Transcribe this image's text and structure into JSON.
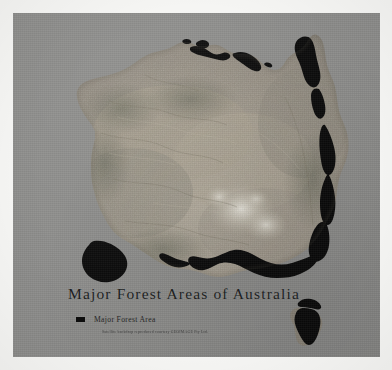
{
  "page": {
    "background_color": "#f7f7f5",
    "panel_color": "#8e8e8c"
  },
  "map": {
    "title": "Major Forest Areas of Australia",
    "subject": "Australia",
    "imagery_type": "satellite-backdrop",
    "land_color": "#9a968e",
    "forest_color": "#0b0b0b",
    "ocean_color": "#8e8e8c"
  },
  "legend": {
    "items": [
      {
        "label": "Major Forest Area",
        "swatch_color": "#0d0d0d",
        "swatch_name": "forest-area-swatch"
      }
    ]
  },
  "credit": {
    "text": "Satellite backdrop reproduced courtesy GEOIMAGE Pty Ltd."
  },
  "regions": [
    {
      "name": "cape-york-queensland-coast",
      "label": "Cape York / north Queensland coastal forest"
    },
    {
      "name": "east-coast-great-dividing-range",
      "label": "East coast forest belt"
    },
    {
      "name": "southeast-victoria-coast",
      "label": "South-east Victorian forest belt"
    },
    {
      "name": "tasmania",
      "label": "Tasmania forest"
    },
    {
      "name": "southwest-western-australia",
      "label": "South-west Western Australia forest"
    },
    {
      "name": "top-end-arnhem-land",
      "label": "Top End / Arnhem Land forest patches"
    }
  ]
}
